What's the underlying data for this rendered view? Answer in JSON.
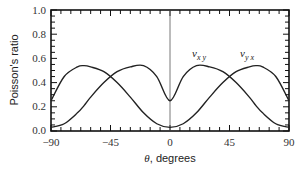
{
  "chart_data": {
    "type": "line",
    "title": "",
    "xlabel": "θ, degrees",
    "ylabel": "Poisson's ratio",
    "xlim": [
      -90,
      90
    ],
    "ylim": [
      0.0,
      1.0
    ],
    "x_ticks": [
      "-90",
      "-45",
      "0",
      "45",
      "90"
    ],
    "y_ticks": [
      "0.0",
      "0.2",
      "0.4",
      "0.6",
      "0.8",
      "1.0"
    ],
    "grid": false,
    "legend": "none (inline curve labels)",
    "vertical_reference_line_at_x": 0,
    "x": [
      -90,
      -80,
      -70,
      -65,
      -60,
      -50,
      -40,
      -30,
      -20,
      -10,
      0,
      10,
      20,
      30,
      40,
      50,
      60,
      65,
      70,
      80,
      90
    ],
    "series": [
      {
        "name": "ν_xy",
        "label_main": "ν",
        "label_sub": "x y",
        "values": [
          0.25,
          0.45,
          0.53,
          0.54,
          0.53,
          0.49,
          0.4,
          0.28,
          0.15,
          0.06,
          0.03,
          0.06,
          0.15,
          0.28,
          0.4,
          0.49,
          0.53,
          0.54,
          0.53,
          0.45,
          0.25
        ]
      },
      {
        "name": "ν_yx",
        "label_main": "ν",
        "label_sub": "y x",
        "values": [
          0.03,
          0.06,
          0.15,
          0.21,
          0.28,
          0.4,
          0.49,
          0.53,
          0.54,
          0.45,
          0.25,
          0.45,
          0.54,
          0.53,
          0.49,
          0.4,
          0.28,
          0.21,
          0.15,
          0.06,
          0.03
        ]
      }
    ]
  },
  "axes": {
    "xlabel": "θ, degrees",
    "ylabel": "Poisson's ratio",
    "x_ticks": [
      "−90",
      "−45",
      "0",
      "45",
      "90"
    ],
    "y_ticks": [
      "0.0",
      "0.2",
      "0.4",
      "0.6",
      "0.8",
      "1.0"
    ]
  },
  "labels": {
    "nu": "ν",
    "xy_sub": "x y",
    "yx_sub": "y x"
  }
}
